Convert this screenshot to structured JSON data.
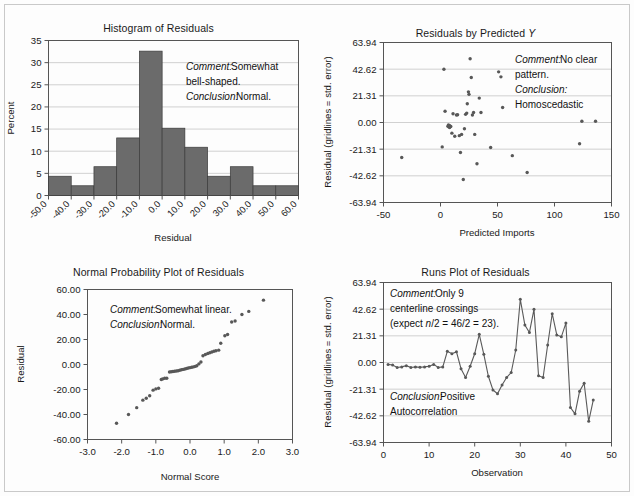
{
  "figure": {
    "background_color": "#fdfdfd",
    "frame_color": "#c9c9c9",
    "bar_color": "#6b6b6b",
    "point_color": "#585858",
    "grid_color": "#c5c5c5"
  },
  "panels": {
    "histogram": {
      "title": "Histogram of Residuals",
      "xlabel": "Residual",
      "ylabel": "Percent",
      "comment_label": "Comment:",
      "comment_text": "Somewhat",
      "comment_text2": "bell-shaped.",
      "conclusion_label": "Conclusion:",
      "conclusion_text": "Normal."
    },
    "residuals_by_predicted": {
      "title_main": "Residuals by Predicted ",
      "title_italic": "Y",
      "xlabel": "Predicted Imports",
      "ylabel": "Residual (gridlines = std. error)",
      "comment_label": "Comment:",
      "comment_text": "No clear",
      "comment_text2": "pattern.",
      "conclusion_label": "Conclusion:",
      "conclusion_text": "Homoscedastic"
    },
    "normal_probability": {
      "title": "Normal Probability Plot of Residuals",
      "xlabel": "Normal Score",
      "ylabel": "Residual",
      "comment_label": "Comment:",
      "comment_text": "Somewhat linear.",
      "conclusion_label": "Conclusion:",
      "conclusion_text": "Normal."
    },
    "runs_plot": {
      "title": "Runs Plot of Residuals",
      "xlabel": "Observation",
      "ylabel": "Residual (gridlines = std. error)",
      "comment_label": "Comment:",
      "comment_text": "Only 9",
      "comment_text2": "centerline crossings",
      "comment_text3_pre": "(expect ",
      "comment_text3_ital": "n",
      "comment_text3_post": "/2 = 46/2 = 23).",
      "conclusion_label": "Conclusion:",
      "conclusion_text": "Positive",
      "conclusion_text2": "Autocorrelation"
    }
  },
  "chart_data": [
    {
      "id": "histogram",
      "type": "bar",
      "title": "Histogram of Residuals",
      "xlabel": "Residual",
      "ylabel": "Percent",
      "categories": [
        "-50.0",
        "-40.0",
        "-30.0",
        "-20.0",
        "-10.0",
        "0.0",
        "10.0",
        "20.0",
        "30.0",
        "40.0",
        "50.0",
        "60.0"
      ],
      "bin_edges": [
        -50,
        -40,
        -30,
        -20,
        -10,
        0,
        10,
        20,
        30,
        40,
        50,
        60
      ],
      "values": [
        4.35,
        2.2,
        6.5,
        13.0,
        32.6,
        15.2,
        10.9,
        4.35,
        6.5,
        2.2,
        2.2
      ],
      "xtick_labels": [
        "-50.0",
        "-40.0",
        "-30.0",
        "-20.0",
        "-10.0",
        "0.0",
        "10.0",
        "20.0",
        "30.0",
        "40.0",
        "50.0",
        "60.0"
      ],
      "ytick_labels": [
        "0",
        "5",
        "10",
        "15",
        "20",
        "25",
        "30",
        "35"
      ],
      "ylim": [
        0,
        35
      ],
      "xlim": [
        -50,
        60
      ],
      "grid": true,
      "legend": "none"
    },
    {
      "id": "residuals_by_predicted",
      "type": "scatter",
      "title": "Residuals by Predicted Y",
      "xlabel": "Predicted Imports",
      "ylabel": "Residual (gridlines = std. error)",
      "xtick_labels": [
        "-50",
        "0",
        "50",
        "100",
        "150"
      ],
      "ytick_labels": [
        "-63.94",
        "-42.62",
        "-21.31",
        "0.00",
        "21.31",
        "42.62",
        "63.94"
      ],
      "xlim": [
        -50,
        150
      ],
      "ylim": [
        -63.94,
        63.94
      ],
      "grid": true,
      "legend": "none",
      "points": [
        [
          -34,
          -28.0
        ],
        [
          1.5,
          -19.5
        ],
        [
          3.0,
          42.6
        ],
        [
          4.0,
          9.0
        ],
        [
          6.5,
          -3.0
        ],
        [
          7.0,
          -2.0
        ],
        [
          7.5,
          -3.5
        ],
        [
          7.8,
          -2.5
        ],
        [
          8.0,
          -4.0
        ],
        [
          8.2,
          -2.8
        ],
        [
          9.0,
          -3.2
        ],
        [
          10.0,
          -8.5
        ],
        [
          11.0,
          7.0
        ],
        [
          12.5,
          -11.0
        ],
        [
          14.0,
          6.0
        ],
        [
          15.0,
          6.2
        ],
        [
          16.5,
          -10.5
        ],
        [
          17.5,
          -24.0
        ],
        [
          18.5,
          -9.5
        ],
        [
          20.0,
          -45.5
        ],
        [
          21.0,
          -5.0
        ],
        [
          22.0,
          6.5
        ],
        [
          23.0,
          7.5
        ],
        [
          23.5,
          15.0
        ],
        [
          24.5,
          24.5
        ],
        [
          25.0,
          22.5
        ],
        [
          26.0,
          51.0
        ],
        [
          27.0,
          36.0
        ],
        [
          28.0,
          6.0
        ],
        [
          29.0,
          8.0
        ],
        [
          30.0,
          -9.5
        ],
        [
          32.0,
          -33.0
        ],
        [
          34.0,
          19.5
        ],
        [
          35.5,
          8.0
        ],
        [
          44.0,
          -20.0
        ],
        [
          51.0,
          40.5
        ],
        [
          53.0,
          36.5
        ],
        [
          54.5,
          12.0
        ],
        [
          63.0,
          -26.5
        ],
        [
          76.0,
          -40.0
        ],
        [
          122.0,
          -17.0
        ],
        [
          124.0,
          1.0
        ],
        [
          136.0,
          1.0
        ]
      ]
    },
    {
      "id": "normal_probability",
      "type": "scatter",
      "title": "Normal Probability Plot of Residuals",
      "xlabel": "Normal Score",
      "ylabel": "Residual",
      "xtick_labels": [
        "-3.0",
        "-2.0",
        "-1.0",
        "0.0",
        "1.0",
        "2.0",
        "3.0"
      ],
      "ytick_labels": [
        "-60.00",
        "-40.00",
        "-20.00",
        "0.00",
        "20.00",
        "40.00",
        "60.00"
      ],
      "xlim": [
        -3.0,
        3.0
      ],
      "ylim": [
        -60,
        60
      ],
      "grid": false,
      "legend": "none",
      "points": [
        [
          -2.15,
          -47.0
        ],
        [
          -1.8,
          -40.0
        ],
        [
          -1.56,
          -34.5
        ],
        [
          -1.38,
          -28.5
        ],
        [
          -1.28,
          -27.0
        ],
        [
          -1.18,
          -25.0
        ],
        [
          -1.08,
          -20.5
        ],
        [
          -1.0,
          -19.5
        ],
        [
          -0.92,
          -19.0
        ],
        [
          -0.84,
          -12.0
        ],
        [
          -0.8,
          -11.5
        ],
        [
          -0.74,
          -11.0
        ],
        [
          -0.68,
          -11.0
        ],
        [
          -0.6,
          -6.0
        ],
        [
          -0.55,
          -5.8
        ],
        [
          -0.5,
          -5.6
        ],
        [
          -0.45,
          -5.4
        ],
        [
          -0.4,
          -5.2
        ],
        [
          -0.35,
          -5.0
        ],
        [
          -0.3,
          -4.6
        ],
        [
          -0.25,
          -4.2
        ],
        [
          -0.2,
          -3.9
        ],
        [
          -0.15,
          -3.6
        ],
        [
          -0.1,
          -3.2
        ],
        [
          -0.05,
          -2.8
        ],
        [
          0.0,
          -2.5
        ],
        [
          0.05,
          -2.2
        ],
        [
          0.1,
          -1.9
        ],
        [
          0.15,
          -1.5
        ],
        [
          0.2,
          -1.0
        ],
        [
          0.26,
          0.5
        ],
        [
          0.32,
          2.0
        ],
        [
          0.38,
          7.0
        ],
        [
          0.45,
          8.0
        ],
        [
          0.52,
          8.8
        ],
        [
          0.58,
          9.4
        ],
        [
          0.64,
          10.0
        ],
        [
          0.7,
          10.6
        ],
        [
          0.76,
          11.0
        ],
        [
          0.84,
          11.5
        ],
        [
          0.9,
          17.0
        ],
        [
          1.02,
          23.0
        ],
        [
          1.1,
          24.0
        ],
        [
          1.22,
          34.0
        ],
        [
          1.32,
          34.8
        ],
        [
          1.52,
          40.0
        ],
        [
          1.72,
          42.5
        ],
        [
          2.15,
          51.5
        ]
      ]
    },
    {
      "id": "runs_plot",
      "type": "line",
      "title": "Runs Plot of Residuals",
      "xlabel": "Observation",
      "ylabel": "Residual (gridlines = std. error)",
      "xtick_labels": [
        "0",
        "10",
        "20",
        "30",
        "40",
        "50"
      ],
      "ytick_labels": [
        "-63.94",
        "-42.62",
        "-21.31",
        "0.00",
        "21.31",
        "42.62",
        "63.94"
      ],
      "xlim": [
        0,
        50
      ],
      "ylim": [
        -63.94,
        63.94
      ],
      "grid": true,
      "legend": "none",
      "x": [
        1,
        2,
        3,
        4,
        5,
        6,
        7,
        8,
        9,
        10,
        11,
        12,
        13,
        14,
        15,
        16,
        17,
        18,
        19,
        20,
        21,
        22,
        23,
        24,
        25,
        26,
        27,
        28,
        29,
        30,
        31,
        32,
        33,
        34,
        35,
        36,
        37,
        38,
        39,
        40,
        41,
        42,
        43,
        44,
        45,
        46
      ],
      "values": [
        -1.5,
        -2.0,
        -4.0,
        -3.5,
        -2.5,
        -4.0,
        -3.5,
        -3.8,
        -3.5,
        -3.0,
        -1.5,
        -4.0,
        -3.5,
        9.0,
        7.0,
        8.5,
        -5.0,
        -12.0,
        -3.0,
        7.0,
        22.5,
        6.5,
        -11.0,
        -22.0,
        -25.0,
        -18.0,
        -12.0,
        -8.0,
        10.0,
        50.5,
        30.0,
        24.0,
        42.5,
        -10.5,
        -12.0,
        14.0,
        39.0,
        22.0,
        20.5,
        31.5,
        -36.0,
        -41.0,
        -23.0,
        -16.5,
        -47.0,
        -30.0
      ]
    }
  ]
}
